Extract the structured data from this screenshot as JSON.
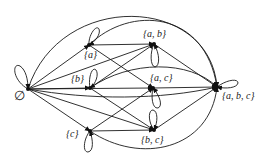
{
  "diagram": {
    "type": "directed-graph",
    "nodes": [
      {
        "id": "empty",
        "label": "∅",
        "x": 28,
        "y": 89,
        "lx": 14,
        "ly": 100,
        "loop": "M28,89 C12,80 12,62 20,66 C26,70 28,80 28,89"
      },
      {
        "id": "a",
        "label": "{a}",
        "x": 89,
        "y": 45,
        "lx": 84,
        "ly": 58,
        "loop": "M89,45 C88,36 96,24 99,29 C101,34 95,42 89,45"
      },
      {
        "id": "b",
        "label": "{b}",
        "x": 90,
        "y": 88,
        "lx": 71,
        "ly": 82,
        "loop": "M90,88 C88,78 92,66 96,70 C99,74 96,84 90,88"
      },
      {
        "id": "c",
        "label": "{c}",
        "x": 90,
        "y": 131,
        "lx": 66,
        "ly": 137,
        "loop": "M90,131 C84,138 82,152 88,152 C94,151 93,140 90,131"
      },
      {
        "id": "ab",
        "label": "{a, b}",
        "x": 154,
        "y": 44,
        "lx": 143,
        "ly": 37,
        "loop": "M154,44 C150,52 150,66 155,67 C160,66 160,54 154,44"
      },
      {
        "id": "ac",
        "label": "{a, c}",
        "x": 153,
        "y": 88,
        "lx": 150,
        "ly": 81,
        "loop": "M153,88 C151,96 152,109 158,108 C163,106 160,96 153,88"
      },
      {
        "id": "bc",
        "label": "{b, c}",
        "x": 154,
        "y": 130,
        "lx": 141,
        "ly": 143,
        "loop": "M154,130 C148,122 148,110 153,110 C158,111 158,122 154,130"
      },
      {
        "id": "abc",
        "label": "{a, b, c}",
        "x": 217,
        "y": 87,
        "lx": 222,
        "ly": 99,
        "loop": "M217,87 C226,80 238,78 238,83 C237,88 226,89 217,87"
      }
    ],
    "edges": [
      {
        "from": "empty",
        "to": "a",
        "path": "M28,89 L89,45"
      },
      {
        "from": "empty",
        "to": "b",
        "path": "M28,89 L90,88"
      },
      {
        "from": "empty",
        "to": "c",
        "path": "M28,89 L90,131"
      },
      {
        "from": "empty",
        "to": "ab",
        "path": "M28,89 L154,44"
      },
      {
        "from": "empty",
        "to": "ac",
        "path": "M28,89 L153,88"
      },
      {
        "from": "empty",
        "to": "bc",
        "path": "M28,89 L154,130"
      },
      {
        "from": "empty",
        "to": "abc",
        "path": "M28,89 C60,-10 210,-5 217,87"
      },
      {
        "from": "empty",
        "to": "abc",
        "path": "M28,89 C90,100 160,100 217,87"
      },
      {
        "from": "a",
        "to": "ab",
        "path": "M89,45 L154,44"
      },
      {
        "from": "a",
        "to": "ac",
        "path": "M89,45 L153,88"
      },
      {
        "from": "a",
        "to": "abc",
        "path": "M89,45 C130,5 205,10 217,87"
      },
      {
        "from": "b",
        "to": "ab",
        "path": "M90,88 L154,44"
      },
      {
        "from": "b",
        "to": "bc",
        "path": "M90,88 L154,130"
      },
      {
        "from": "b",
        "to": "abc",
        "path": "M90,88 C130,60 190,60 217,87"
      },
      {
        "from": "c",
        "to": "ac",
        "path": "M90,131 L153,88"
      },
      {
        "from": "c",
        "to": "bc",
        "path": "M90,131 L154,130"
      },
      {
        "from": "c",
        "to": "abc",
        "path": "M90,131 C140,165 210,150 217,87"
      },
      {
        "from": "ab",
        "to": "abc",
        "path": "M154,44 L217,87"
      },
      {
        "from": "ac",
        "to": "abc",
        "path": "M153,88 L217,87"
      },
      {
        "from": "bc",
        "to": "abc",
        "path": "M154,130 L217,87"
      }
    ]
  }
}
